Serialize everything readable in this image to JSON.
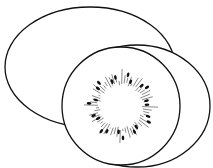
{
  "image": {
    "title": "Kiwi fruit line drawing",
    "description": "Whole kiwi behind a sliced kiwi half showing seeds around the core",
    "colors": {
      "stroke": "#111111",
      "fill": "#ffffff",
      "seed": "#111111"
    }
  },
  "shapes": {
    "whole_kiwi": {
      "cx": 90,
      "cy": 67,
      "rx": 85,
      "ry": 60
    },
    "slice_skin": {
      "cx": 137,
      "cy": 106,
      "rx": 73,
      "ry": 61
    },
    "slice_flesh": {
      "cx": 121,
      "cy": 106,
      "rx": 59,
      "ry": 59
    },
    "seed_ring": {
      "cx": 121,
      "cy": 106,
      "inner_r": 20,
      "outer_r": 33,
      "seed_count": 22
    }
  }
}
